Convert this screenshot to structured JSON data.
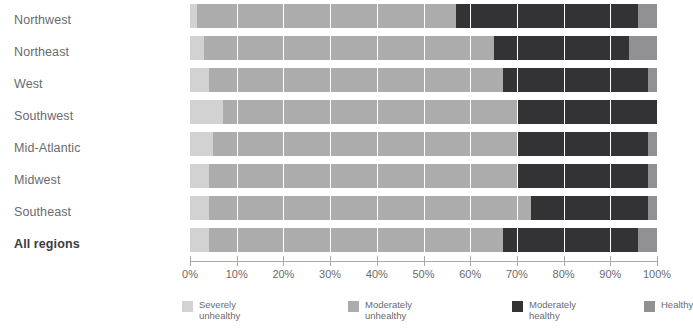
{
  "chart_data": {
    "type": "bar",
    "orientation": "horizontal",
    "stacked": true,
    "normalized_percent": true,
    "title": "",
    "subtitle": "",
    "xlabel": "",
    "ylabel": "",
    "xlim": [
      0,
      100
    ],
    "xticks": [
      0,
      10,
      20,
      30,
      40,
      50,
      60,
      70,
      80,
      90,
      100
    ],
    "xtick_labels": [
      "0%",
      "10%",
      "20%",
      "30%",
      "40%",
      "50%",
      "60%",
      "70%",
      "80%",
      "90%",
      "100%"
    ],
    "grid": true,
    "grid_axis": "x",
    "grid_color": "#ffffff",
    "legend_position": "bottom",
    "categories": [
      "Northwest",
      "Northeast",
      "West",
      "Southwest",
      "Mid-Atlantic",
      "Midwest",
      "Southeast",
      "All regions"
    ],
    "emphasized_categories": [
      "All regions"
    ],
    "series": [
      {
        "name": "Severely\nunhealthy",
        "legend_label": "Severely\nunhealthy",
        "color": "#d2d2d2",
        "values": [
          1.5,
          3.0,
          4.0,
          7.0,
          5.0,
          4.0,
          4.0,
          4.0
        ]
      },
      {
        "name": "Moderately\nunhealthy",
        "legend_label": "Moderately\nunhealthy",
        "color": "#acacac",
        "values": [
          55.5,
          62.0,
          63.0,
          63.0,
          65.0,
          66.0,
          69.0,
          63.0
        ]
      },
      {
        "name": "Moderately\nhealthy",
        "legend_label": "Moderately\nhealthy",
        "color": "#333335",
        "values": [
          39.0,
          29.0,
          31.0,
          30.0,
          28.0,
          28.0,
          25.0,
          29.0
        ]
      },
      {
        "name": "Healthy",
        "legend_label": "Healthy",
        "color": "#919193",
        "values": [
          4.0,
          6.0,
          2.0,
          0.0,
          2.0,
          2.0,
          2.0,
          4.0
        ]
      }
    ]
  }
}
